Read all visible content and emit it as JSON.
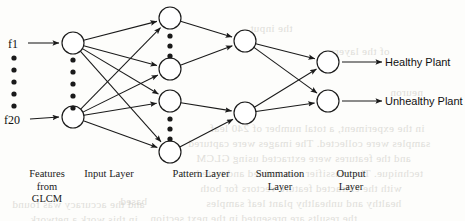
{
  "figure": {
    "type": "neural-network-diagram",
    "canvas": {
      "width": 465,
      "height": 221
    },
    "stroke_color": "#1a1a1a",
    "node_fill": "#ffffff"
  },
  "features": {
    "first_label": "f1",
    "last_label": "f20",
    "ellipsis_dot_count": 5,
    "first_pos": {
      "x": 8,
      "y": 37
    },
    "last_pos": {
      "x": 4,
      "y": 113
    },
    "dots_x": 14,
    "dots_y": [
      58,
      70,
      82,
      94,
      106
    ]
  },
  "layers": [
    {
      "id": "input",
      "label": "Input Layer",
      "label_pos": {
        "x": 72,
        "y": 168
      },
      "node_x": 73,
      "nodes_y": [
        43,
        117
      ],
      "ellipsis_dot_count": 5,
      "dots_y": [
        60,
        72,
        84,
        96,
        108
      ]
    },
    {
      "id": "pattern",
      "label": "Pattern Layer",
      "label_pos": {
        "x": 158,
        "y": 168
      },
      "node_x": 170,
      "nodes_y": [
        18,
        69,
        101,
        152
      ],
      "ellipsis_dot_count": 3,
      "dots_groups": [
        [
          36,
          46,
          56
        ],
        [
          119,
          129,
          139
        ]
      ]
    },
    {
      "id": "summation",
      "label": "Summation\nLayer",
      "label_pos": {
        "x": 240,
        "y": 168
      },
      "node_x": 245,
      "nodes_y": [
        41,
        113
      ]
    },
    {
      "id": "output",
      "label": "Output\nLayer",
      "label_pos": {
        "x": 320,
        "y": 168
      },
      "node_x": 328,
      "nodes_y": [
        62,
        101
      ]
    }
  ],
  "feature_block_label": "Features\nfrom\nGLCM",
  "feature_block_pos": {
    "x": 10,
    "y": 168
  },
  "outputs": [
    {
      "label": "Healthy Plant",
      "x": 385,
      "y": 56,
      "arrow_from_x": 342,
      "arrow_to_x": 382,
      "arrow_y": 62
    },
    {
      "label": "Unhealthy Plant",
      "x": 385,
      "y": 95,
      "arrow_from_x": 342,
      "arrow_to_x": 382,
      "arrow_y": 101
    }
  ],
  "node_radius": 11,
  "dot_radius": 2.6,
  "edges": {
    "feature_to_input": [
      {
        "x1": 28,
        "y1": 43,
        "x2": 59,
        "y2": 43
      },
      {
        "x1": 30,
        "y1": 119,
        "x2": 59,
        "y2": 117
      }
    ],
    "input_to_pattern": [
      {
        "from": [
          0,
          43
        ],
        "to": [
          0,
          18
        ]
      },
      {
        "from": [
          0,
          43
        ],
        "to": [
          1,
          69
        ]
      },
      {
        "from": [
          0,
          43
        ],
        "to": [
          2,
          101
        ]
      },
      {
        "from": [
          0,
          43
        ],
        "to": [
          3,
          152
        ]
      },
      {
        "from": [
          1,
          117
        ],
        "to": [
          0,
          18
        ]
      },
      {
        "from": [
          1,
          117
        ],
        "to": [
          1,
          69
        ]
      },
      {
        "from": [
          1,
          117
        ],
        "to": [
          2,
          101
        ]
      },
      {
        "from": [
          1,
          117
        ],
        "to": [
          3,
          152
        ]
      }
    ],
    "pattern_to_summation": [
      {
        "from": [
          0,
          18
        ],
        "to": [
          0,
          41
        ]
      },
      {
        "from": [
          1,
          69
        ],
        "to": [
          0,
          41
        ]
      },
      {
        "from": [
          2,
          101
        ],
        "to": [
          1,
          113
        ]
      },
      {
        "from": [
          3,
          152
        ],
        "to": [
          1,
          113
        ]
      }
    ],
    "summation_to_output": [
      {
        "from": [
          0,
          41
        ],
        "to": [
          0,
          62
        ]
      },
      {
        "from": [
          0,
          41
        ],
        "to": [
          1,
          101
        ]
      },
      {
        "from": [
          1,
          113
        ],
        "to": [
          0,
          62
        ]
      },
      {
        "from": [
          1,
          113
        ],
        "to": [
          1,
          101
        ]
      }
    ]
  },
  "background_text": {
    "note": "faint bleed-through text from reverse side of scanned page",
    "lines": [
      {
        "text": "in the experiment, a total number of 240 leaf",
        "x": 210,
        "y": 122,
        "size": 11
      },
      {
        "text": "samples were collected. The images were captured",
        "x": 188,
        "y": 137,
        "size": 11
      },
      {
        "text": "and the features were extracted using GLCM",
        "x": 196,
        "y": 152,
        "size": 11
      },
      {
        "text": "technique. The classifier was trained and tested",
        "x": 196,
        "y": 167,
        "size": 11
      },
      {
        "text": "with the extracted feature vectors for both",
        "x": 200,
        "y": 182,
        "size": 11
      },
      {
        "text": "healthy and unhealthy plant leaf samples",
        "x": 206,
        "y": 197,
        "size": 11
      },
      {
        "text": "the results are presented in the next section",
        "x": 150,
        "y": 212,
        "size": 11
      },
      {
        "text": "and the accuracy was found",
        "x": 12,
        "y": 198,
        "size": 11
      },
      {
        "text": "in this work a network",
        "x": 30,
        "y": 213,
        "size": 11
      },
      {
        "text": "of the layers",
        "x": 330,
        "y": 45,
        "size": 11
      },
      {
        "text": "the input",
        "x": 250,
        "y": 22,
        "size": 11
      },
      {
        "text": "neuron",
        "x": 390,
        "y": 86,
        "size": 11
      },
      {
        "text": "based",
        "x": 120,
        "y": 195,
        "size": 11
      }
    ]
  }
}
